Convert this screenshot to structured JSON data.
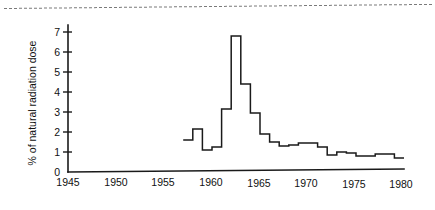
{
  "figure": {
    "background_color": "#ffffff",
    "ink_color": "#1a1a1a",
    "top_rule": {
      "name": "page-separator-dashed-rule",
      "style": "dashed"
    }
  },
  "chart_data": {
    "type": "line",
    "subtype": "step-post",
    "title": "",
    "subtitle": "",
    "xlabel": "",
    "ylabel": "% of natural radiation dose",
    "xlim": [
      1945,
      1980
    ],
    "ylim": [
      0,
      7.4
    ],
    "grid": false,
    "legend": false,
    "legend_position": "none",
    "xticks": [
      1945,
      1950,
      1955,
      1960,
      1965,
      1970,
      1975,
      1980
    ],
    "xtick_labels": [
      "1945",
      "1950",
      "1955",
      "1960",
      "1965",
      "1970",
      "1975",
      "1980"
    ],
    "yticks": [
      0,
      1,
      2,
      3,
      4,
      5,
      6,
      7
    ],
    "ytick_labels": [
      "0",
      "1",
      "2",
      "3",
      "4",
      "5",
      "6",
      "7"
    ],
    "x": [
      1957,
      1958,
      1959,
      1960,
      1961,
      1962,
      1963,
      1964,
      1965,
      1966,
      1967,
      1968,
      1969,
      1970,
      1971,
      1972,
      1973,
      1974,
      1975,
      1976,
      1977,
      1978,
      1979
    ],
    "values": [
      1.6,
      2.15,
      1.1,
      1.25,
      3.15,
      6.8,
      4.4,
      2.95,
      1.9,
      1.5,
      1.3,
      1.35,
      1.45,
      1.45,
      1.25,
      0.85,
      1.0,
      0.95,
      0.8,
      0.8,
      0.9,
      0.9,
      0.7
    ],
    "series": [
      {
        "name": "% of natural radiation dose",
        "values": [
          1.6,
          2.15,
          1.1,
          1.25,
          3.15,
          6.8,
          4.4,
          2.95,
          1.9,
          1.5,
          1.3,
          1.35,
          1.45,
          1.45,
          1.25,
          0.85,
          1.0,
          0.95,
          0.8,
          0.8,
          0.9,
          0.9,
          0.7
        ]
      }
    ],
    "annotations": [],
    "peak": {
      "x": 1962,
      "y": 6.8
    }
  }
}
